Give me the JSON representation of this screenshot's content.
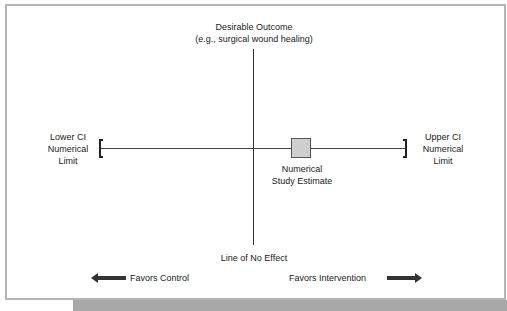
{
  "diagram": {
    "top_label": {
      "line1": "Desirable Outcome",
      "line2": "(e.g., surgical wound healing)"
    },
    "left_limit": {
      "line1": "Lower CI",
      "line2": "Numerical",
      "line3": "Limit"
    },
    "right_limit": {
      "line1": "Upper CI",
      "line2": "Numerical",
      "line3": "Limit"
    },
    "estimate": {
      "line1": "Numerical",
      "line2": "Study Estimate",
      "fill_color": "#cfcfcf"
    },
    "no_effect_label": "Line of No Effect",
    "favors_left": "Favors Control",
    "favors_right": "Favors Intervention"
  },
  "caption": {
    "label": "",
    "text": ""
  }
}
